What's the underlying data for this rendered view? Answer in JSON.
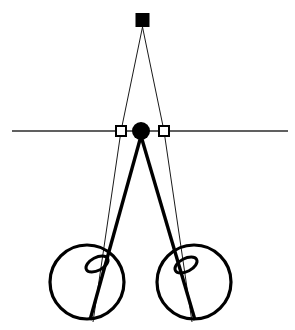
{
  "figure": {
    "background_color": "#ffffff",
    "ink_color": "#000000",
    "width": 295,
    "height": 330
  },
  "elements": {
    "target_marker": {
      "name": "filled-square-target",
      "shape": "filled-square",
      "cx": 142.5,
      "cy": 20,
      "size": 14,
      "color": "#000000"
    },
    "nodal_marker": {
      "name": "filled-circle-node",
      "shape": "filled-circle",
      "cx": 141,
      "cy": 131,
      "r": 9,
      "color": "#000000"
    },
    "left_open_marker": {
      "name": "open-square-left",
      "shape": "open-square",
      "cx": 121,
      "cy": 131,
      "size": 10,
      "fill": "#ffffff",
      "stroke": "#000000"
    },
    "right_open_marker": {
      "name": "open-square-right",
      "shape": "open-square",
      "cx": 164,
      "cy": 131,
      "size": 10,
      "fill": "#ffffff",
      "stroke": "#000000"
    },
    "horizontal_axis": {
      "name": "horizontal-reference-line",
      "x1": 12,
      "y1": 131,
      "x2": 288,
      "y2": 131,
      "stroke": "#2b2b2b",
      "stroke_width": 1.3
    },
    "left_wheel": {
      "name": "left-eye-circle",
      "cx": 87,
      "cy": 282,
      "r": 37,
      "stroke": "#000000",
      "stroke_width": 3.2
    },
    "right_wheel": {
      "name": "right-eye-circle",
      "cx": 194,
      "cy": 282,
      "r": 37,
      "stroke": "#000000",
      "stroke_width": 3.2
    },
    "left_inner_ellipse": {
      "name": "left-pupil-ellipse",
      "cx": 97,
      "cy": 264,
      "rx": 12,
      "ry": 6.5,
      "rotation": -28
    },
    "right_inner_ellipse": {
      "name": "right-pupil-ellipse",
      "cx": 186,
      "cy": 265,
      "rx": 12,
      "ry": 6.5,
      "rotation": -28
    },
    "thin_ray_left": {
      "name": "thin-ray-left",
      "points": "142.5,27 121,131 93,322"
    },
    "thin_ray_right": {
      "name": "thin-ray-right",
      "points": "142.5,27 164,131 192,322"
    },
    "thick_ray_left": {
      "name": "thick-ray-left",
      "points": "141,136 90,320"
    },
    "thick_ray_right": {
      "name": "thick-ray-right",
      "points": "141,136 195,320"
    }
  }
}
